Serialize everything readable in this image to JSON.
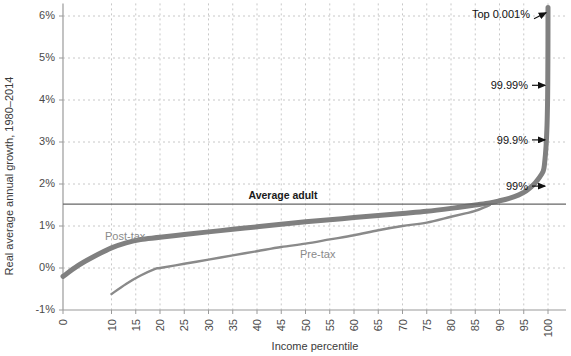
{
  "chart_data": {
    "type": "line",
    "title": "",
    "xlabel": "Income percentile",
    "ylabel": "Real average annual growth, 1980–2014",
    "xlim": [
      0,
      100
    ],
    "ylim": [
      -1,
      6.3
    ],
    "grid": true,
    "legend_position": "inline-annotations",
    "x_ticks": [
      "0",
      "10",
      "15",
      "20",
      "25",
      "30",
      "35",
      "40",
      "45",
      "50",
      "55",
      "60",
      "65",
      "70",
      "75",
      "80",
      "85",
      "90",
      "95",
      "100"
    ],
    "x_tick_values": [
      0,
      10,
      15,
      20,
      25,
      30,
      35,
      40,
      45,
      50,
      55,
      60,
      65,
      70,
      75,
      80,
      85,
      90,
      95,
      100
    ],
    "y_ticks": [
      "-1%",
      "0%",
      "1%",
      "2%",
      "3%",
      "4%",
      "5%",
      "6%"
    ],
    "y_tick_values": [
      -1,
      0,
      1,
      2,
      3,
      4,
      5,
      6
    ],
    "series": [
      {
        "name": "Post-tax",
        "label": "Post-tax",
        "color": "#808080",
        "width": 5,
        "x": [
          0,
          3,
          6,
          10,
          13,
          16,
          20,
          25,
          30,
          35,
          40,
          45,
          50,
          55,
          60,
          65,
          70,
          75,
          80,
          85,
          88,
          90,
          92,
          94,
          95,
          96,
          97,
          98,
          99,
          99.3,
          99.6,
          99.8,
          99.9,
          99.95,
          99.99,
          99.999
        ],
        "y": [
          -0.2,
          0.05,
          0.25,
          0.48,
          0.6,
          0.68,
          0.73,
          0.8,
          0.86,
          0.92,
          0.98,
          1.04,
          1.1,
          1.15,
          1.2,
          1.25,
          1.3,
          1.35,
          1.42,
          1.5,
          1.55,
          1.6,
          1.66,
          1.74,
          1.8,
          1.88,
          1.98,
          2.12,
          2.3,
          2.5,
          2.9,
          3.4,
          3.9,
          4.4,
          5.3,
          6.2
        ]
      },
      {
        "name": "Pre-tax",
        "label": "Pre-tax",
        "color": "#8a8a8a",
        "width": 2.4,
        "x": [
          10,
          13,
          16,
          19,
          20,
          25,
          30,
          35,
          40,
          45,
          50,
          55,
          60,
          65,
          70,
          75,
          80,
          83,
          85,
          87,
          88
        ],
        "y": [
          -0.62,
          -0.38,
          -0.18,
          -0.02,
          0.0,
          0.1,
          0.2,
          0.3,
          0.4,
          0.5,
          0.58,
          0.68,
          0.78,
          0.9,
          1.0,
          1.08,
          1.22,
          1.3,
          1.36,
          1.45,
          1.5
        ]
      }
    ],
    "reference_line": {
      "label": "Average adult",
      "value": 1.52,
      "color": "#666666"
    },
    "annotations": [
      {
        "label": "Top 0.001%",
        "target_x": 100,
        "target_y": 6.15
      },
      {
        "label": "99.99%",
        "target_x": 100,
        "target_y": 4.35
      },
      {
        "label": "99.9%",
        "target_x": 100,
        "target_y": 3.05
      },
      {
        "label": "99%",
        "target_x": 100,
        "target_y": 1.95
      }
    ]
  },
  "style": {
    "background": "#ffffff",
    "grid_color": "#c8c8c8",
    "axis_color": "#9a9a9a",
    "text_color": "#3a3a3a"
  }
}
